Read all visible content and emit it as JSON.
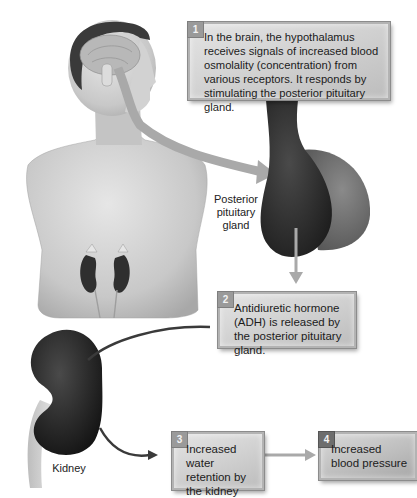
{
  "figure": {
    "steps": [
      {
        "number": "1",
        "text": "In the brain, the hypothalamus receives signals of increased blood osmolality (concentration) from various receptors. It responds by stimulating the posterior pituitary gland."
      },
      {
        "number": "2",
        "text": "Antidiuretic hormone (ADH) is released by the posterior pituitary gland."
      },
      {
        "number": "3",
        "text": "Increased water retention by the kidney"
      },
      {
        "number": "4",
        "text": "Increased blood pressure"
      }
    ],
    "labels": {
      "pituitary": "Posterior pituitary gland",
      "kidney": "Kidney"
    },
    "colors": {
      "box_fill": "#cfcfcf",
      "box_border": "#8c8c8c",
      "badge": "#9a9a9a",
      "arrow_light": "#a9a9a9",
      "arrow_dark": "#3a3a3a",
      "gland_dark": "#2c2c2c",
      "gland_light": "#6e6e6e"
    }
  }
}
